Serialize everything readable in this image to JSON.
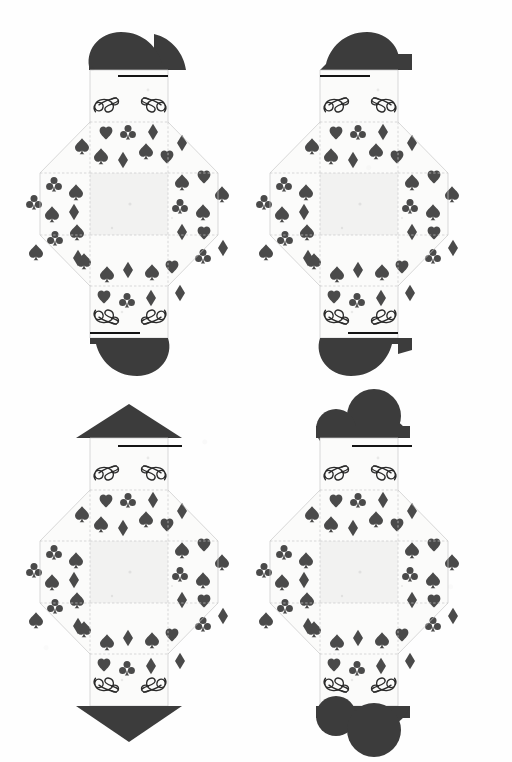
{
  "sheet": {
    "title": "Playing Card Suit Envelope Templates",
    "description": "Printable papercraft sheet with four square envelope nets decorated with playing-card suit pips",
    "background_color": "#ffffff",
    "paper_color": "#fbfbfa",
    "ink_dark": "#3c3c3c",
    "pip_color": "#4a4a4a",
    "foldline_color": "#c9c9c9",
    "scoreline_color": "#141414",
    "columns": 2,
    "rows": 2,
    "net_count": 4
  },
  "legend": {
    "fold_line_label": "fold line",
    "cut_line_label": "cut line",
    "score_bar_label": "score bar"
  },
  "nets": [
    {
      "id": "net-1",
      "position": "top-left",
      "top_flap_shape": "heart-half-left",
      "top_flap_name": "heart-flap",
      "bottom_flap_shape": "heart-half-left",
      "bottom_flap_name": "heart-flap",
      "suit_theme": "hearts",
      "pip_pattern": [
        "heart",
        "club",
        "diamond",
        "spade"
      ],
      "has_score_bar_top": true,
      "has_score_bar_bottom": true,
      "flourish_count": 4
    },
    {
      "id": "net-2",
      "position": "top-right",
      "top_flap_shape": "heart-half-right",
      "top_flap_name": "heart-flap-mirrored",
      "bottom_flap_shape": "heart-half-right",
      "bottom_flap_name": "heart-flap-mirrored",
      "suit_theme": "hearts",
      "pip_pattern": [
        "heart",
        "club",
        "diamond",
        "spade"
      ],
      "has_score_bar_top": true,
      "has_score_bar_bottom": true,
      "flourish_count": 4
    },
    {
      "id": "net-3",
      "position": "bottom-left",
      "top_flap_shape": "spade-point",
      "top_flap_name": "spade-flap",
      "bottom_flap_shape": "spade-point-inverted",
      "bottom_flap_name": "spade-flap-inverted",
      "suit_theme": "spades",
      "pip_pattern": [
        "heart",
        "club",
        "diamond",
        "spade"
      ],
      "has_score_bar_top": true,
      "has_score_bar_bottom": false,
      "flourish_count": 4
    },
    {
      "id": "net-4",
      "position": "bottom-right",
      "top_flap_shape": "club-lobes",
      "top_flap_name": "club-flap",
      "bottom_flap_shape": "club-lobes",
      "bottom_flap_name": "club-flap",
      "suit_theme": "clubs",
      "pip_pattern": [
        "heart",
        "club",
        "diamond",
        "spade"
      ],
      "has_score_bar_top": true,
      "has_score_bar_bottom": false,
      "flourish_count": 4
    }
  ]
}
